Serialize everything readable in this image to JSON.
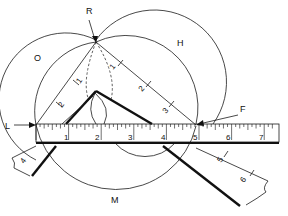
{
  "figure": {
    "point_labels": {
      "R": "R",
      "O": "O",
      "H": "H",
      "L": "L",
      "F": "F",
      "M": "M"
    },
    "rule": {
      "numbers": [
        "1",
        "2",
        "3",
        "4",
        "5",
        "6",
        "7"
      ]
    },
    "square_left_arm": {
      "numbers": [
        "1",
        "2",
        "4"
      ]
    },
    "square_right_arm": {
      "numbers": [
        "1",
        "2",
        "3",
        "5",
        "6"
      ]
    },
    "colors": {
      "ink": "#111111",
      "paper": "#ffffff"
    }
  }
}
